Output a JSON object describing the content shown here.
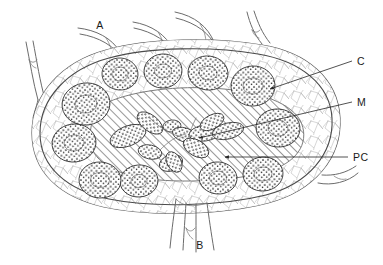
{
  "figure": {
    "type": "anatomical-diagram",
    "background_color": "#ffffff",
    "line_color": "#4a4a4a",
    "ink_color": "#1a1a1a"
  },
  "labels": [
    {
      "id": "A",
      "text": "A",
      "meaning": "afferent lymphatic vessels",
      "x": 100,
      "y": 29,
      "anchor": "middle",
      "has_leader": false
    },
    {
      "id": "B",
      "text": "B",
      "meaning": "efferent lymphatic vessel at hilum",
      "x": 200,
      "y": 249,
      "anchor": "middle",
      "has_leader": false
    },
    {
      "id": "C",
      "text": "C",
      "meaning": "cortex with lymphoid follicle",
      "x": 357,
      "y": 65,
      "anchor": "start",
      "has_leader": true
    },
    {
      "id": "M",
      "text": "M",
      "meaning": "medullary cords",
      "x": 357,
      "y": 106,
      "anchor": "start",
      "has_leader": true
    },
    {
      "id": "PC",
      "text": "PC",
      "meaning": "paracortex / medullary sinus",
      "x": 353,
      "y": 161,
      "anchor": "start",
      "has_leader": true
    }
  ],
  "leaders": [
    {
      "for": "C",
      "points": "352,61 268,90",
      "arrow": true,
      "arrow_at": "268,90"
    },
    {
      "for": "M",
      "points": "352,102 196,139",
      "arrow": true,
      "arrow_at": "196,139"
    },
    {
      "for": "PC",
      "points": "348,157 222,157",
      "arrow": true,
      "arrow_at": "222,157"
    }
  ],
  "structures": {
    "capsule": {
      "name": "capsule",
      "shape": "bean-oval",
      "stroke": "#5a5a5a"
    },
    "cortex": {
      "name": "cortex",
      "texture": "fine reticular network",
      "stroke": "#8d8d8d"
    },
    "medulla": {
      "name": "medulla",
      "texture": "diagonal hatching",
      "angle_deg": 45,
      "stroke": "#6e6e6e"
    },
    "follicle_count": 12,
    "follicle_texture": "dense stipple with pale germinal centre",
    "medullary_cord_count": 10,
    "afferent_vessel_count": 4,
    "efferent_vessel_count": 1,
    "hilum_position": "bottom-centre"
  },
  "follicles": [
    {
      "cx": 86,
      "cy": 104,
      "rx": 24,
      "ry": 21,
      "rot": -8
    },
    {
      "cx": 120,
      "cy": 74,
      "rx": 18,
      "ry": 16,
      "rot": 4
    },
    {
      "cx": 163,
      "cy": 71,
      "rx": 19,
      "ry": 17,
      "rot": -6
    },
    {
      "cx": 208,
      "cy": 73,
      "rx": 20,
      "ry": 17,
      "rot": 7
    },
    {
      "cx": 253,
      "cy": 86,
      "rx": 22,
      "ry": 20,
      "rot": -3
    },
    {
      "cx": 278,
      "cy": 128,
      "rx": 22,
      "ry": 19,
      "rot": 6
    },
    {
      "cx": 263,
      "cy": 174,
      "rx": 20,
      "ry": 17,
      "rot": -4
    },
    {
      "cx": 218,
      "cy": 178,
      "rx": 19,
      "ry": 16,
      "rot": 5
    },
    {
      "cx": 139,
      "cy": 181,
      "rx": 19,
      "ry": 16,
      "rot": -5
    },
    {
      "cx": 100,
      "cy": 180,
      "rx": 21,
      "ry": 18,
      "rot": 3
    },
    {
      "cx": 74,
      "cy": 143,
      "rx": 22,
      "ry": 19,
      "rot": -7
    },
    {
      "cx": 155,
      "cy": 130,
      "rx": 16,
      "ry": 14,
      "rot": 0
    }
  ]
}
